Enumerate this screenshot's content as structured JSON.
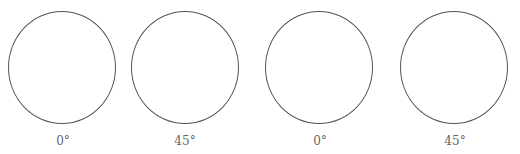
{
  "figure": {
    "panels": [
      {
        "angle_label": "0°"
      },
      {
        "angle_label": "45°"
      },
      {
        "angle_label": "0°"
      },
      {
        "angle_label": "45°"
      }
    ],
    "stroke_color": "#555555",
    "label_color": "#666666"
  }
}
